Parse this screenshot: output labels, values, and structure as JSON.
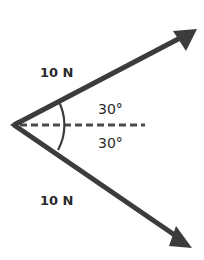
{
  "diagram": {
    "type": "force-vector-diagram",
    "colors": {
      "vector": "#3c3c3c",
      "dashed_line": "#4a4a4a",
      "text": "#2a2a2a",
      "background": "#ffffff"
    },
    "vectors": [
      {
        "label": "10 N",
        "direction": "upper-right",
        "angle_deg": 30
      },
      {
        "label": "10 N",
        "direction": "lower-right",
        "angle_deg": -30
      }
    ],
    "angles": [
      {
        "label": "30°",
        "position": "above-reference"
      },
      {
        "label": "30°",
        "position": "below-reference"
      }
    ],
    "reference_line": "dashed horizontal"
  }
}
